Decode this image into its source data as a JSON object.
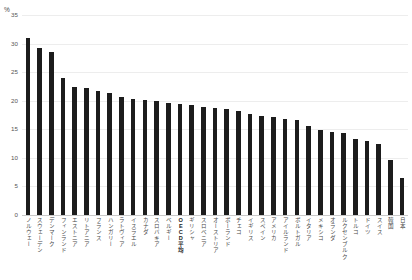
{
  "axis": {
    "unit_label": "%",
    "y_ticks": [
      "0",
      "5",
      "10",
      "15",
      "20",
      "25",
      "30",
      "35"
    ]
  },
  "chart_data": {
    "type": "bar",
    "title": "",
    "subtitle": "",
    "xlabel": "",
    "ylabel": "%",
    "ylim": [
      0,
      35
    ],
    "grid": true,
    "legend": "none",
    "orientation": "vertical",
    "bar_color": "#1c1c1c",
    "categories": [
      "ノルウェー",
      "スウェーデン",
      "デンマーク",
      "フィンランド",
      "エストニア",
      "リトアニア",
      "フランス",
      "ハンガリー",
      "ラトヴィア",
      "イスラエル",
      "カナダ",
      "スロバキア",
      "ベルギー",
      "OECD平均",
      "ギリシャ",
      "スロベニア",
      "オーストリア",
      "ポーランド",
      "チェコ",
      "イギリス",
      "スペイン",
      "アメリカ",
      "アイルランド",
      "ポルトガル",
      "イタリア",
      "メキシコ",
      "オランダ",
      "ルクセンブルク",
      "トルコ",
      "ドイツ",
      "スイス",
      "韓国",
      "日本"
    ],
    "values": [
      31.0,
      29.2,
      28.5,
      23.9,
      22.4,
      22.3,
      21.7,
      21.3,
      20.6,
      20.3,
      20.1,
      19.9,
      19.6,
      19.4,
      19.2,
      18.9,
      18.7,
      18.5,
      18.2,
      17.7,
      17.3,
      17.1,
      16.8,
      16.6,
      15.6,
      14.9,
      14.6,
      14.4,
      13.3,
      12.9,
      12.4,
      9.6,
      6.4
    ]
  }
}
